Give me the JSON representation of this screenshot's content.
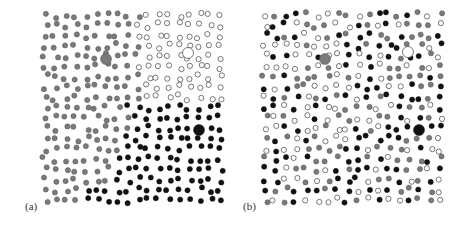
{
  "figure": {
    "panels": [
      {
        "id": "a",
        "label": "(a)",
        "label_pos": [
          25,
          208
        ],
        "offset_x": 0,
        "description": "Three segregated domains: gray (left), white/open (top-right), black (bottom-right)",
        "big_dots": [
          {
            "x": 106,
            "y": 59,
            "color": "gray"
          },
          {
            "x": 188,
            "y": 53,
            "color": "white"
          },
          {
            "x": 199,
            "y": 130,
            "color": "black"
          }
        ]
      },
      {
        "id": "b",
        "label": "(b)",
        "label_pos": [
          243,
          208
        ],
        "offset_x": 0,
        "description": "Randomly mixed gray, white and black particles",
        "big_dots": [
          {
            "x": 325,
            "y": 59,
            "color": "gray"
          },
          {
            "x": 408,
            "y": 52,
            "color": "white"
          },
          {
            "x": 419,
            "y": 130,
            "color": "black"
          }
        ]
      }
    ],
    "colors": {
      "gray": "#7a7a7a",
      "white": "#ffffff",
      "black": "#111111",
      "stroke": "#555555"
    }
  }
}
